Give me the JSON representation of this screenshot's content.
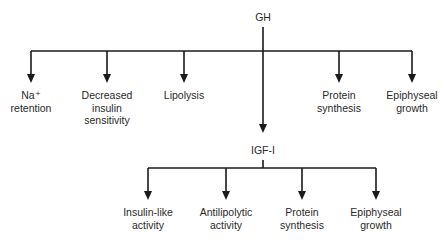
{
  "root": {
    "label": "GH",
    "x": 263,
    "y": 11
  },
  "gh_effects": [
    {
      "lines": [
        "Na⁺",
        "retention"
      ],
      "x": 31
    },
    {
      "lines": [
        "Decreased",
        "insulin",
        "sensitivity"
      ],
      "x": 107
    },
    {
      "lines": [
        "Lipolysis"
      ],
      "x": 184
    },
    {
      "lines": [
        "Protein",
        "synthesis"
      ],
      "x": 339
    },
    {
      "lines": [
        "Epiphyseal",
        "growth"
      ],
      "x": 412
    }
  ],
  "mediator": {
    "label": "IGF-I",
    "x": 263,
    "y": 144
  },
  "igf_effects": [
    {
      "lines": [
        "Insulin-like",
        "activity"
      ],
      "x": 148
    },
    {
      "lines": [
        "Antilipolytic",
        "activity"
      ],
      "x": 226
    },
    {
      "lines": [
        "Protein",
        "synthesis"
      ],
      "x": 302
    },
    {
      "lines": [
        "Epiphyseal",
        "growth"
      ],
      "x": 376
    }
  ],
  "colors": {
    "line": "#1a1a1a",
    "text": "#2a2a2a",
    "background": "#ffffff"
  }
}
